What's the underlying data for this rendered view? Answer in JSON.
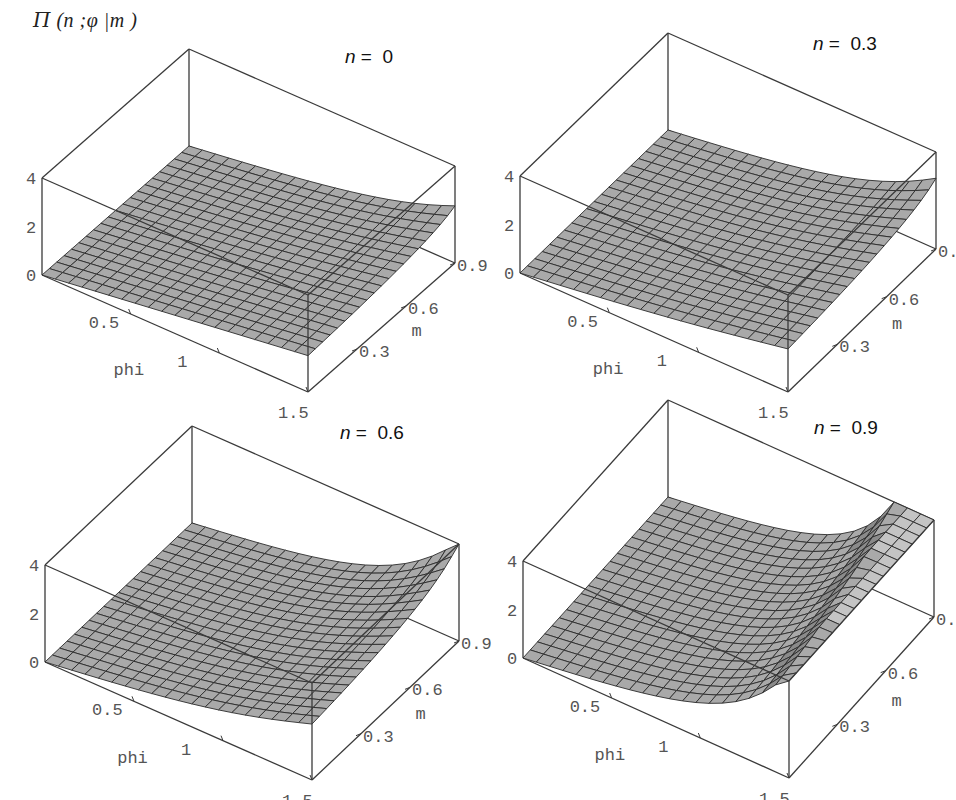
{
  "figure": {
    "title": "Π (n ;φ |m )",
    "title_parts": {
      "symbol": "Π",
      "args": " (n ;φ |m )"
    }
  },
  "panels": [
    {
      "id": "n0",
      "label_var": "n",
      "label_rest": " =  0",
      "n": 0.0
    },
    {
      "id": "n03",
      "label_var": "n",
      "label_rest": " =  0.3",
      "n": 0.3
    },
    {
      "id": "n06",
      "label_var": "n",
      "label_rest": " =  0.6",
      "n": 0.6
    },
    {
      "id": "n09",
      "label_var": "n",
      "label_rest": " =  0.9",
      "n": 0.9
    }
  ],
  "axes": {
    "x_label": "phi",
    "y_label": "m",
    "z_ticks": [
      "0",
      "2",
      "4"
    ],
    "x_ticks": [
      "0.5",
      "1",
      "1.5"
    ],
    "y_ticks": [
      "0.3",
      "0.6",
      "0.9"
    ]
  },
  "colors": {
    "surface_fill": "#a9a9a9",
    "surface_fill_light": "#c4c4c4",
    "mesh_line": "#2b2b2b",
    "box_line": "#3a3a3a",
    "tick_text": "#555555"
  },
  "chart_data": [
    {
      "type": "surface",
      "title": "n = 0",
      "function": "Incomplete elliptic integral of the third kind Π(n; φ | m)",
      "xlabel": "phi",
      "ylabel": "m",
      "zlabel": "Π (n ;φ |m )",
      "xlim": [
        0,
        1.5
      ],
      "ylim": [
        0,
        0.9
      ],
      "zlim": [
        0,
        4
      ],
      "x_ticks": [
        0.5,
        1,
        1.5
      ],
      "y_ticks": [
        0.3,
        0.6,
        0.9
      ],
      "z_ticks": [
        0,
        2,
        4
      ],
      "grid_points": 20,
      "params": {
        "n": 0.0
      },
      "corner_values": {
        "phi0_m0": 0,
        "phi1.5_m0": 1.5,
        "phi1.5_m0.9": 2.3
      }
    },
    {
      "type": "surface",
      "title": "n = 0.3",
      "xlabel": "phi",
      "ylabel": "m",
      "zlabel": "Π (n ;φ |m )",
      "xlim": [
        0,
        1.5
      ],
      "ylim": [
        0,
        0.9
      ],
      "zlim": [
        0,
        4
      ],
      "x_ticks": [
        0.5,
        1,
        1.5
      ],
      "y_ticks": [
        0.3,
        0.6,
        0.9
      ],
      "z_ticks": [
        0,
        2,
        4
      ],
      "grid_points": 20,
      "params": {
        "n": 0.3
      },
      "corner_values": {
        "phi0_m0": 0,
        "phi1.5_m0": 1.8,
        "phi1.5_m0.9": 2.8
      }
    },
    {
      "type": "surface",
      "title": "n = 0.6",
      "xlabel": "phi",
      "ylabel": "m",
      "zlabel": "Π (n ;φ |m )",
      "xlim": [
        0,
        1.5
      ],
      "ylim": [
        0,
        0.9
      ],
      "zlim": [
        0,
        4
      ],
      "x_ticks": [
        0.5,
        1,
        1.5
      ],
      "y_ticks": [
        0.3,
        0.6,
        0.9
      ],
      "z_ticks": [
        0,
        2,
        4
      ],
      "grid_points": 20,
      "params": {
        "n": 0.6
      },
      "corner_values": {
        "phi0_m0": 0,
        "phi1.5_m0": 2.3,
        "phi1.5_m0.9": 4.0
      }
    },
    {
      "type": "surface",
      "title": "n = 0.9",
      "xlabel": "phi",
      "ylabel": "m",
      "zlabel": "Π (n ;φ |m )",
      "xlim": [
        0,
        1.5
      ],
      "ylim": [
        0,
        0.9
      ],
      "zlim": [
        0,
        4
      ],
      "x_ticks": [
        0.5,
        1,
        1.5
      ],
      "y_ticks": [
        0.3,
        0.6,
        0.9
      ],
      "z_ticks": [
        0,
        2,
        4
      ],
      "grid_points": 20,
      "params": {
        "n": 0.9
      },
      "corner_values": {
        "phi0_m0": 0,
        "phi1.5_m0": "clipped above 4",
        "phi1.5_m0.9": "clipped above 4"
      },
      "notes": "Surface rises steeply near phi=1.5 and is clipped at z=4 (flat top strip)"
    }
  ]
}
